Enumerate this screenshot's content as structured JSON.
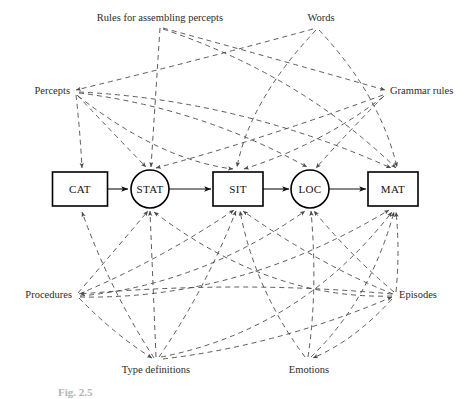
{
  "figure": {
    "caption": "Fig. 2.5",
    "background_color": "#ffffff",
    "line_color": "#4a4a4a",
    "node_stroke_color": "#000000",
    "text_color": "#1a1a1a"
  },
  "chain_nodes": [
    {
      "id": "cat",
      "label": "CAT",
      "shape": "rect",
      "cx": 80,
      "cy": 189,
      "w": 55,
      "h": 34
    },
    {
      "id": "stat",
      "label": "STAT",
      "shape": "circle",
      "cx": 150,
      "cy": 189,
      "r": 19
    },
    {
      "id": "sit",
      "label": "SIT",
      "shape": "rect",
      "cx": 238,
      "cy": 189,
      "w": 50,
      "h": 34
    },
    {
      "id": "loc",
      "label": "LOC",
      "shape": "circle",
      "cx": 310,
      "cy": 189,
      "r": 19
    },
    {
      "id": "mat",
      "label": "MAT",
      "shape": "rect",
      "cx": 393,
      "cy": 189,
      "w": 50,
      "h": 34
    }
  ],
  "chain_arrows": [
    {
      "from": "cat",
      "to": "stat"
    },
    {
      "from": "stat",
      "to": "sit"
    },
    {
      "from": "sit",
      "to": "loc"
    },
    {
      "from": "loc",
      "to": "mat"
    }
  ],
  "peripheral_labels": [
    {
      "id": "rules-for-assembling-percepts",
      "label": "Rules for assembling percepts",
      "x": 160,
      "y": 19,
      "anchor": "middle",
      "side": "top"
    },
    {
      "id": "words",
      "label": "Words",
      "x": 321,
      "y": 19,
      "anchor": "middle",
      "side": "top"
    },
    {
      "id": "percepts",
      "label": "Percepts",
      "x": 70,
      "y": 92,
      "anchor": "end",
      "side": "left"
    },
    {
      "id": "grammar-rules",
      "label": "Grammar rules",
      "x": 390,
      "y": 92,
      "anchor": "start",
      "side": "right"
    },
    {
      "id": "procedures",
      "label": "Procedures",
      "x": 72,
      "y": 296,
      "anchor": "end",
      "side": "left"
    },
    {
      "id": "episodes",
      "label": "Episodes",
      "x": 399,
      "y": 296,
      "anchor": "start",
      "side": "right"
    },
    {
      "id": "type-definitions",
      "label": "Type definitions",
      "x": 156,
      "y": 371,
      "anchor": "middle",
      "side": "bottom"
    },
    {
      "id": "emotions",
      "label": "Emotions",
      "x": 309,
      "y": 371,
      "anchor": "middle",
      "side": "bottom"
    }
  ],
  "dashed_connections": [
    {
      "from": "percepts",
      "to": "cat"
    },
    {
      "from": "percepts",
      "to": "stat"
    },
    {
      "from": "percepts",
      "to": "sit"
    },
    {
      "from": "percepts",
      "to": "loc"
    },
    {
      "from": "percepts",
      "to": "mat"
    },
    {
      "from": "rules-for-assembling-percepts",
      "to": "stat"
    },
    {
      "from": "rules-for-assembling-percepts",
      "to": "mat"
    },
    {
      "from": "rules-for-assembling-percepts",
      "to": "cat"
    },
    {
      "from": "words",
      "to": "cat"
    },
    {
      "from": "words",
      "to": "sit"
    },
    {
      "from": "words",
      "to": "mat"
    },
    {
      "from": "grammar-rules",
      "to": "stat"
    },
    {
      "from": "grammar-rules",
      "to": "sit"
    },
    {
      "from": "grammar-rules",
      "to": "loc"
    },
    {
      "from": "procedures",
      "to": "stat"
    },
    {
      "from": "procedures",
      "to": "sit"
    },
    {
      "from": "procedures",
      "to": "loc"
    },
    {
      "from": "procedures",
      "to": "mat"
    },
    {
      "from": "type-definitions",
      "to": "cat"
    },
    {
      "from": "type-definitions",
      "to": "stat"
    },
    {
      "from": "type-definitions",
      "to": "sit"
    },
    {
      "from": "type-definitions",
      "to": "mat"
    },
    {
      "from": "emotions",
      "to": "sit"
    },
    {
      "from": "emotions",
      "to": "loc"
    },
    {
      "from": "emotions",
      "to": "mat"
    },
    {
      "from": "episodes",
      "to": "cat"
    },
    {
      "from": "episodes",
      "to": "stat"
    },
    {
      "from": "episodes",
      "to": "sit"
    },
    {
      "from": "episodes",
      "to": "loc"
    },
    {
      "from": "episodes",
      "to": "mat"
    }
  ]
}
